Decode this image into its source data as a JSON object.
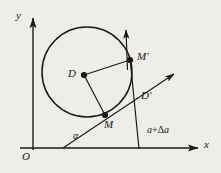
{
  "figure": {
    "kind": "geometry-diagram",
    "background_color": "#efedea",
    "ink_color": "#1a1a1a",
    "width": 221,
    "height": 173
  },
  "axes": {
    "x_label": "x",
    "y_label": "y",
    "origin_label": "O",
    "x_axis": {
      "x1": 20,
      "y1": 148,
      "x2": 202,
      "y2": 148
    },
    "y_axis": {
      "x1": 33,
      "y1": 150,
      "x2": 33,
      "y2": 14
    }
  },
  "circle": {
    "center": {
      "x": 87,
      "y": 72
    },
    "radius": 45,
    "label": "circle"
  },
  "points": [
    {
      "id": "D",
      "label": "D",
      "x": 84,
      "y": 75,
      "label_x": 69,
      "label_y": 69
    },
    {
      "id": "M",
      "label": "M",
      "x": 105,
      "y": 115,
      "label_x": 105,
      "label_y": 121
    },
    {
      "id": "Mp",
      "label": "M'",
      "x": 130,
      "y": 60,
      "label_x": 137,
      "label_y": 52
    }
  ],
  "labels": {
    "d_prime": "D'",
    "alpha": "α",
    "angle_increment_base": "a",
    "angle_increment_plus": "+",
    "angle_increment_delta": "Δ",
    "angle_increment_var": "a"
  },
  "label_positions": {
    "d_prime": {
      "x": 141,
      "y": 92
    },
    "alpha": {
      "x": 73,
      "y": 132
    },
    "angle_increment": {
      "x": 147,
      "y": 126
    }
  },
  "segments": [
    {
      "name": "radius-D-to-M",
      "x1": 84,
      "y1": 75,
      "x2": 105,
      "y2": 115
    },
    {
      "name": "radius-D-to-Mprime",
      "x1": 84,
      "y1": 75,
      "x2": 130,
      "y2": 60
    },
    {
      "name": "vertical-from-Mprime",
      "x1": 130,
      "y1": 60,
      "x2": 139,
      "y2": 148
    }
  ],
  "rays": [
    {
      "name": "ray-alpha",
      "x1": 63,
      "y1": 148,
      "x2": 178,
      "y2": 72,
      "arrow": true
    },
    {
      "name": "tangent-ray",
      "x1": 127,
      "y1": 72,
      "x2": 126,
      "y2": 27,
      "arrow": true
    }
  ]
}
